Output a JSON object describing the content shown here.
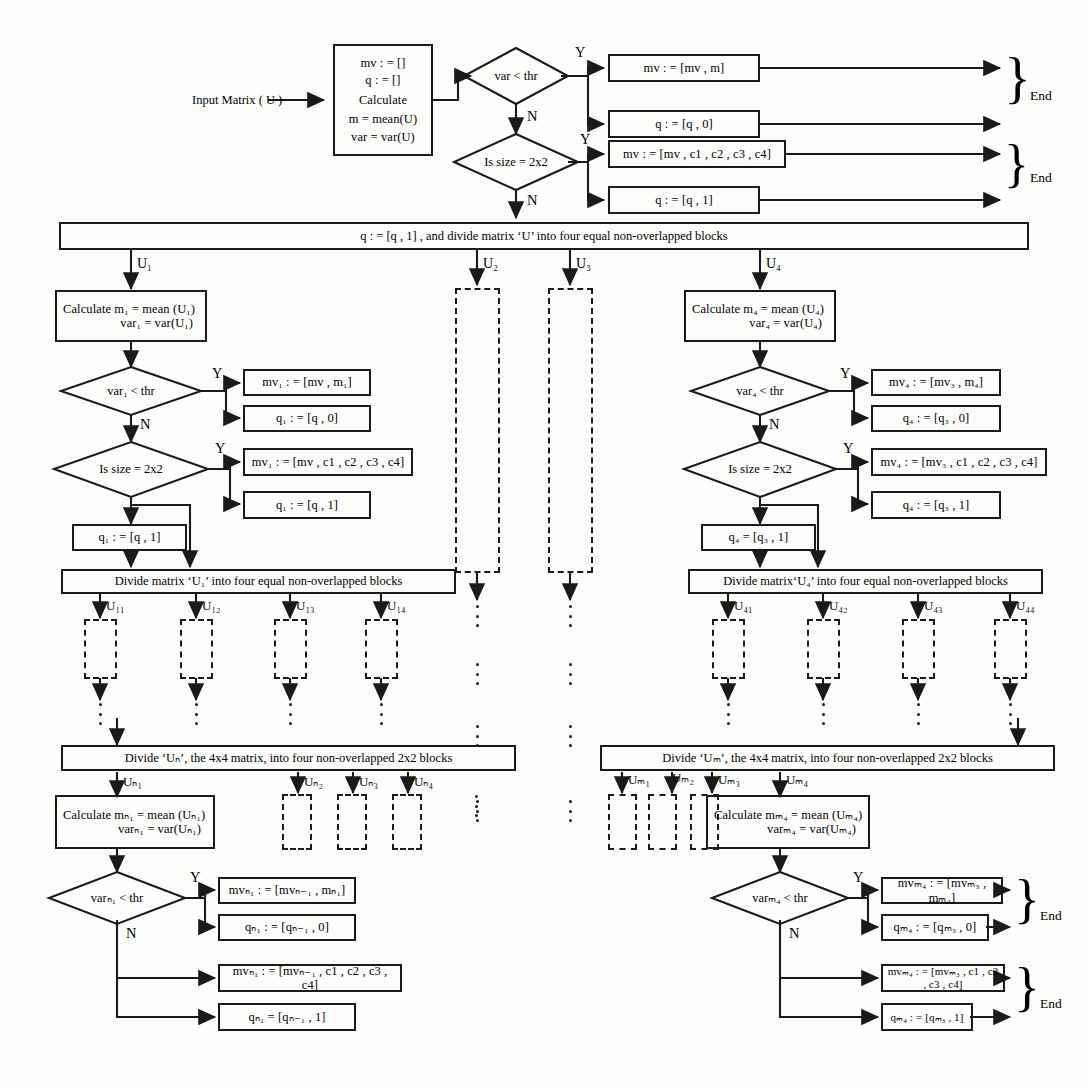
{
  "diagram": {
    "type": "flowchart",
    "labels": {
      "yes": "Y",
      "no": "N",
      "end": "End"
    },
    "top": {
      "input_label": "Input Matrix ( U )",
      "calc_box": {
        "line1": "mv : = []",
        "line2": "q : = []",
        "line3": "Calculate",
        "line4": "m = mean(U)",
        "line5": "var = var(U)"
      },
      "decision_var": "var < thr",
      "decision_size": "Is  size = 2x2",
      "mv_yes": "mv : = [mv , m]",
      "q_yes": "q : = [q , 0]",
      "mv_size": "mv : = [mv , c1 , c2 , c3 , c4]",
      "q_size": "q : = [q , 1]"
    },
    "split_bar": "q : = [q , 1] , and divide matrix ‘U’ into four equal non-overlapped blocks",
    "branch_labels": {
      "u1": "U₁",
      "u2": "U₂",
      "u3": "U₃",
      "u4": "U₄"
    },
    "left_branch": {
      "calc_l1": "Calculate  m₁ = mean (U₁)",
      "calc_l2": "var₁ = var(U₁)",
      "decision_var": "var₁ < thr",
      "decision_size": "Is  size = 2x2",
      "mv_yes": "mv₁ : = [mv , m₁]",
      "q_yes": "q₁ : = [q , 0]",
      "mv_size": "mv₁ : = [mv , c1 , c2 , c3 , c4]",
      "q_size": "q₁ : = [q , 1]",
      "q_final": "q₁ : = [q , 1]",
      "divide_bar": "Divide matrix ‘U₁’ into four equal non-overlapped blocks",
      "sub_labels": [
        "U₁₁",
        "U₁₂",
        "U₁₃",
        "U₁₄"
      ]
    },
    "right_branch": {
      "calc_l1": "Calculate  m₄ = mean (U₄)",
      "calc_l2": "var₄ = var(U₄)",
      "decision_var": "var₄ < thr",
      "decision_size": "Is  size = 2x2",
      "mv_yes": "mv₄ : = [mv₃ , m₄]",
      "q_yes": "q₄ : = [q₃ , 0]",
      "mv_size": "mv₄ : = [mv₃ , c1 , c2 , c3 , c4]",
      "q_size": "q₄ : = [q₃ , 1]",
      "q_final": "q₄ = [q₃ , 1]",
      "divide_bar": "Divide matrix‘U₄’ into four equal non-overlapped blocks",
      "sub_labels": [
        "U₄₁",
        "U₄₂",
        "U₄₃",
        "U₄₄"
      ]
    },
    "bottom_left": {
      "divide_bar": "Divide ‘Uₙ’, the 4x4 matrix, into four non-overlapped 2x2 blocks",
      "sub_labels": [
        "Uₙ₁",
        "Uₙ₂",
        "Uₙ₃",
        "Uₙ₄"
      ],
      "calc_l1": "Calculate  mₙ₁ = mean (Uₙ₁)",
      "calc_l2": "varₙ₁ = var(Uₙ₁)",
      "decision_var": "varₙ₁ < thr",
      "mv_yes": "mvₙ₁ : = [mvₙ₋₁ , mₙ₁]",
      "q_yes": "qₙ₁ : = [qₙ₋₁ , 0]",
      "mv_no": "mvₙ₁ : = [mvₙ₋₁ , c1 , c2 , c3 , c4]",
      "q_no": "qₙ₁ = [qₙ₋₁ , 1]"
    },
    "bottom_right": {
      "divide_bar": "Divide ‘Uₘ’, the 4x4 matrix, into four non-overlapped 2x2 blocks",
      "sub_labels": [
        "Uₘ₁",
        "Uₘ₂",
        "Uₘ₃",
        "Uₘ₄"
      ],
      "calc_l1": "Calculate  mₘ₄ = mean (Uₘ₄)",
      "calc_l2": "varₘ₄ = var(Uₘ₄)",
      "decision_var": "varₘ₄ < thr",
      "mv_yes": "mvₘ₄ : = [mvₘ₃ , mₘ₄]",
      "q_yes": "qₘ₄ : = [qₘ₃ , 0]",
      "mv_no": "mvₘ₄ : = [mvₘ₃ , c1 , c2 , c3 , c4]",
      "q_no": "qₘ₄ : = [qₘ₃ , 1]"
    },
    "colors": {
      "line": "#1a1a1a",
      "background": "#ffffff"
    }
  }
}
